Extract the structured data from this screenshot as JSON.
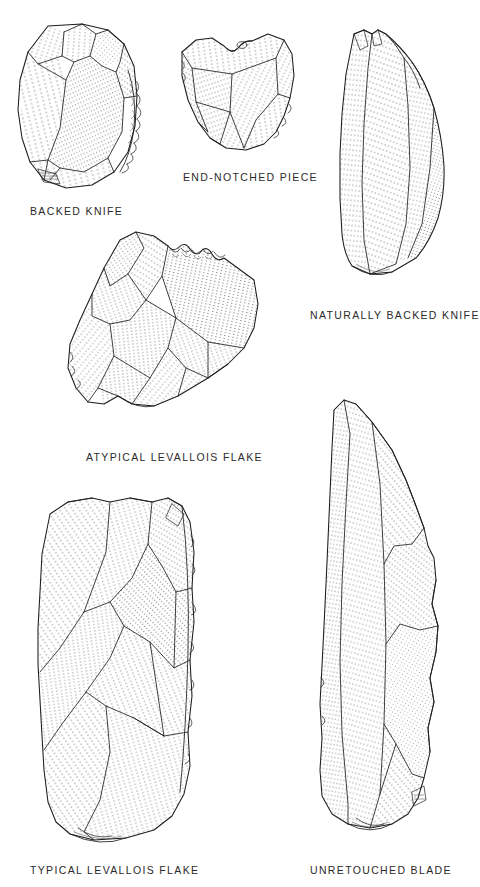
{
  "plate": {
    "title": "Middle Palaeolithic lithic artifact types",
    "background_color": "#ffffff",
    "ink_color": "#1b1b1b",
    "caption_color": "#2b2b2b",
    "width": 471,
    "height": 887
  },
  "figures": [
    {
      "id": "backed-knife",
      "label": "BACKED  KNIFE",
      "caption_x": 30,
      "caption_y": 210,
      "artifact": "ovate flake with steeply retouched (backed) right margin",
      "retouched_edge": "right",
      "facet_count": 7
    },
    {
      "id": "end-notched-piece",
      "label": "END-NOTCHED  PIECE",
      "caption_x": 183,
      "caption_y": 176,
      "artifact": "trapezoidal flake with concave notch removed from the distal end",
      "retouched_edge": "top",
      "facet_count": 6
    },
    {
      "id": "naturally-backed-knife",
      "label": "NATURALLY  BACKED  KNIFE",
      "caption_x": 310,
      "caption_y": 314,
      "artifact": "elongate leaf-shaped flake retaining a natural cortical back",
      "retouched_edge": "none",
      "facet_count": 5
    },
    {
      "id": "atypical-levallois-flake",
      "label": "ATYPICAL  LEVALLOIS  FLAKE",
      "caption_x": 86,
      "caption_y": 456,
      "artifact": "irregular polygonal Levallois flake with scalloped dorsal margin",
      "retouched_edge": "upper-right",
      "facet_count": 9
    },
    {
      "id": "typical-levallois-flake",
      "label": "TYPICAL  LEVALLOIS  FLAKE",
      "caption_x": 30,
      "caption_y": 869,
      "artifact": "large sub-rectangular Levallois flake with centripetal dorsal scars",
      "retouched_edge": "none",
      "facet_count": 8
    },
    {
      "id": "unretouched-blade",
      "label": "UNRETOUCHED  BLADE",
      "caption_x": 310,
      "caption_y": 869,
      "artifact": "long narrow blade with parallel dorsal ridges, unmodified edges",
      "retouched_edge": "none",
      "facet_count": 6
    }
  ]
}
